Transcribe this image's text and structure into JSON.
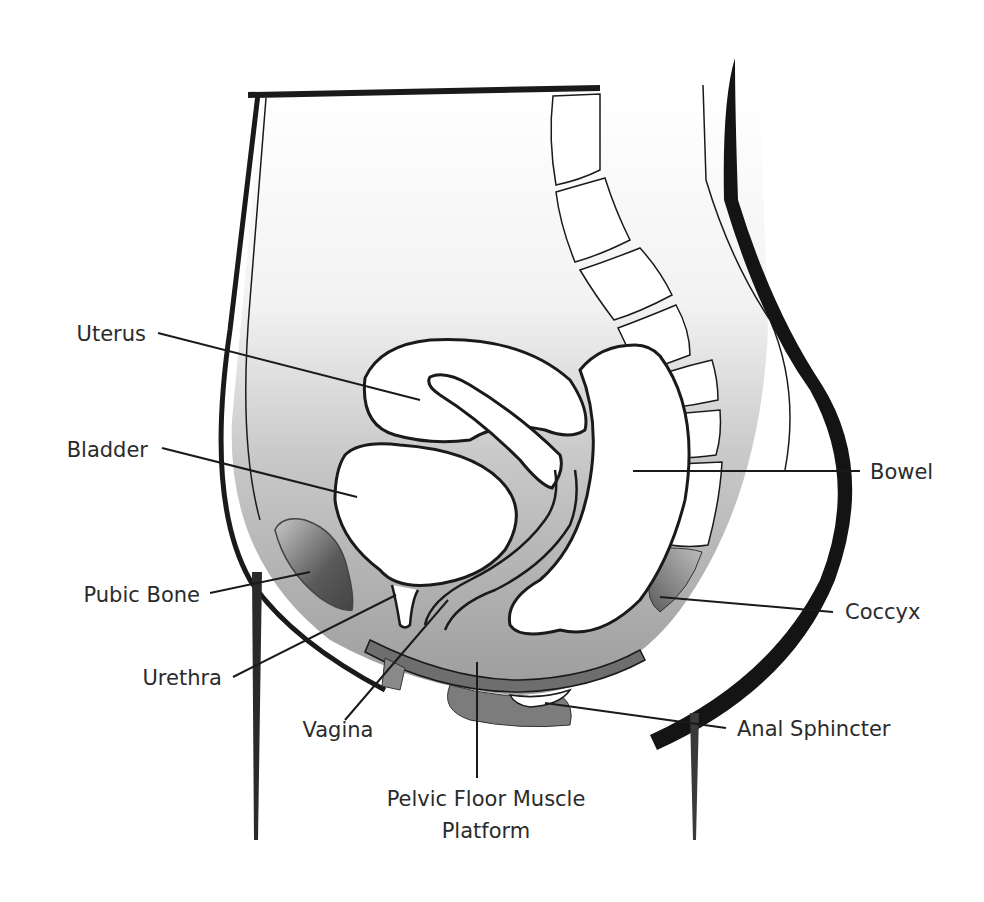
{
  "diagram": {
    "colors": {
      "background": "#ffffff",
      "ink": "#1a1a1a",
      "label_text": "#2b2b2b",
      "tissue_light": "#d9d9d9",
      "tissue_mid": "#a8a8a8",
      "muscle_dark": "#7a7a7a",
      "bone_dark": "#555555",
      "organ_fill": "#ffffff"
    },
    "labels": {
      "uterus": "Uterus",
      "bladder": "Bladder",
      "pubic_bone": "Pubic Bone",
      "urethra": "Urethra",
      "vagina": "Vagina",
      "pelvic_floor_line1": "Pelvic Floor Muscle",
      "pelvic_floor_line2": "Platform",
      "bowel": "Bowel",
      "coccyx": "Coccyx",
      "anal_sphincter": "Anal Sphincter"
    }
  }
}
